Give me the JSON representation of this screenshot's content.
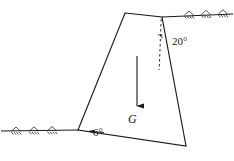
{
  "figure": {
    "type": "engineering-free-body-diagram",
    "background_color": "#ffffff",
    "line_color": "#1a1a1a",
    "labels": {
      "angle_top": "20°",
      "angle_base": "6°",
      "weight": "G"
    },
    "geometry": {
      "body_polygon": [
        {
          "name": "top-left-crest",
          "x": 125,
          "y": 13
        },
        {
          "name": "top-right-crest",
          "x": 162,
          "y": 17
        },
        {
          "name": "bottom-right-toe",
          "x": 186,
          "y": 146
        },
        {
          "name": "bottom-left-heel",
          "x": 78,
          "y": 130
        }
      ],
      "ground_line_right": {
        "x1": 162,
        "y1": 17,
        "x2": 234,
        "y2": 14
      },
      "ground_line_left": {
        "x1": 0,
        "y1": 131,
        "x2": 78,
        "y2": 130
      },
      "dashed_vertical": {
        "x1": 161,
        "y1": 19,
        "x2": 159,
        "y2": 70
      },
      "weight_arrow": {
        "x1": 137,
        "y1": 57,
        "x2": 137,
        "y2": 107
      },
      "right_angle_tick": {
        "x": 159,
        "y": 38
      }
    },
    "hatch_marks": {
      "right_group_count": 3,
      "left_group_count": 3,
      "style": "triangular-ground-support"
    },
    "icons": {
      "weight_arrow": "down-arrow-icon",
      "ground_hatch": "ground-hatch-icon"
    }
  }
}
